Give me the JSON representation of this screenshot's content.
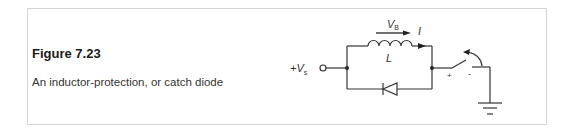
{
  "figure": {
    "title": "Figure 7.23",
    "caption": "An inductor-protection, or catch diode"
  },
  "circuit": {
    "source_label": {
      "prefix": "+V",
      "subscript": "s"
    },
    "inductor_label": "L",
    "voltage_label": {
      "main": "V",
      "subscript": "B"
    },
    "current_label": "I",
    "switch_plus": "+",
    "switch_minus": "-",
    "colors": {
      "line": "#333333",
      "frame": "#d4d4d4"
    }
  }
}
